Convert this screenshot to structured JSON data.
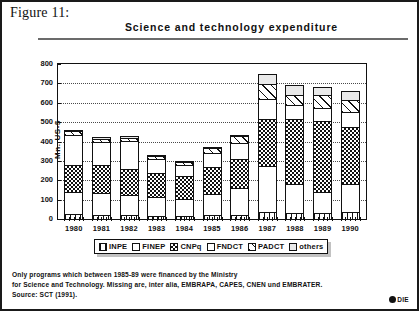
{
  "figure": {
    "label": "Figure 11:",
    "title": "Science and technology expenditure"
  },
  "chart_data": {
    "type": "bar",
    "stacked": true,
    "title": "Science and technology expenditure",
    "xlabel": "",
    "ylabel": "Mn. US-$",
    "ylim": [
      0,
      800
    ],
    "yticks": [
      0,
      100,
      200,
      300,
      400,
      500,
      600,
      700,
      800
    ],
    "grid": true,
    "legend_position": "bottom",
    "categories": [
      "1980",
      "1981",
      "1982",
      "1983",
      "1984",
      "1985",
      "1986",
      "1987",
      "1988",
      "1989",
      "1990"
    ],
    "series": [
      {
        "name": "INPE",
        "pattern": "vertical-stripes",
        "values": [
          30,
          28,
          26,
          22,
          20,
          24,
          26,
          40,
          38,
          34,
          40
        ]
      },
      {
        "name": "FINEP",
        "pattern": "white",
        "values": [
          122,
          118,
          110,
          100,
          92,
          114,
          142,
          242,
          152,
          116,
          150
        ]
      },
      {
        "name": "CNPq",
        "pattern": "checker",
        "values": [
          140,
          148,
          140,
          130,
          124,
          148,
          158,
          250,
          342,
          370,
          302
        ]
      },
      {
        "name": "FNDCT",
        "pattern": "white",
        "values": [
          160,
          124,
          146,
          78,
          66,
          78,
          86,
          108,
          76,
          76,
          80
        ]
      },
      {
        "name": "PADCT",
        "pattern": "diagonal-stripes",
        "values": [
          26,
          22,
          24,
          22,
          20,
          28,
          40,
          82,
          60,
          68,
          68
        ]
      },
      {
        "name": "others",
        "pattern": "light-gray",
        "values": [
          14,
          12,
          12,
          10,
          10,
          10,
          12,
          56,
          54,
          50,
          50
        ]
      }
    ],
    "totals": [
      492,
      452,
      458,
      362,
      332,
      402,
      464,
      778,
      722,
      714,
      690
    ]
  },
  "legend": {
    "items": [
      {
        "label": "INPE",
        "pattern": "vertical-stripes"
      },
      {
        "label": "FINEP",
        "pattern": "white"
      },
      {
        "label": "CNPq",
        "pattern": "checker"
      },
      {
        "label": "FNDCT",
        "pattern": "white"
      },
      {
        "label": "PADCT",
        "pattern": "diagonal-stripes"
      },
      {
        "label": "others",
        "pattern": "light-gray"
      }
    ]
  },
  "footnote": {
    "line1": "Only programs which between 1985-89 were financed by the Ministry",
    "line2": "for Science and Technology. Missing are, inter alia, EMBRAPA, CAPES, CNEN und EMBRATER.",
    "line3": "Source: SCT (1991)."
  },
  "credit": {
    "mark": "copyright-icon",
    "text": "DIE"
  },
  "colors": {
    "ink": "#111111",
    "rule": "#6b6b6b",
    "others_fill": "#e9e9e9",
    "paper": "#ffffff"
  }
}
